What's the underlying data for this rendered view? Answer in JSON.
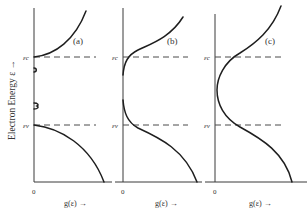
{
  "figure": {
    "y_axis_label": "Electron Energy ε →",
    "colors": {
      "curve": "#1e1e1e",
      "axis": "#3a3a3a",
      "dash": "#4a4a4a",
      "text": "#333333"
    },
    "panels": [
      {
        "id": "a",
        "label": "(a)",
        "origin_label": "0",
        "x_axis_label": "g(ε) →",
        "level_top_label": "εc",
        "level_bottom_label": "εv",
        "description": "Sharp band edges with discrete impurity levels in the gap"
      },
      {
        "id": "b",
        "label": "(b)",
        "origin_label": "0",
        "x_axis_label": "g(ε) →",
        "level_top_label": "εc",
        "level_bottom_label": "εv",
        "description": "Band tails extending into the gap, with a region of near-zero density"
      },
      {
        "id": "c",
        "label": "(c)",
        "origin_label": "0",
        "x_axis_label": "g(ε) →",
        "level_top_label": "εc",
        "level_bottom_label": "εv",
        "description": "Overlapping band tails; density of states finite throughout the gap"
      }
    ]
  }
}
